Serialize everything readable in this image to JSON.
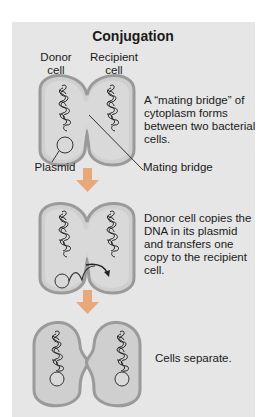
{
  "title": "Conjugation",
  "labels": {
    "donor": "Donor\ncell",
    "recipient": "Recipient\ncell",
    "plasmid": "Plasmid",
    "mating_bridge": "Mating bridge"
  },
  "steps": [
    {
      "description": "A “mating bridge” of cytoplasm forms between two bacterial cells."
    },
    {
      "description": "Donor cell copies the DNA in its plasmid and transfers one copy to the recipient cell."
    },
    {
      "description": "Cells separate."
    }
  ],
  "colors": {
    "panel": "#e6e6e6",
    "cell_fill": "#cfcfcf",
    "cell_border": "#9a9a9a",
    "arrow": "#e8a87c"
  }
}
